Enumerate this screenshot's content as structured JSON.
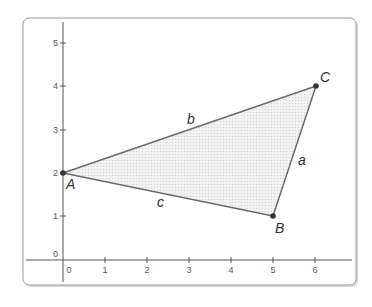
{
  "diagram": {
    "type": "coordinate-plane-triangle",
    "x_ticks": [
      "0",
      "1",
      "2",
      "3",
      "4",
      "5",
      "6"
    ],
    "y_ticks": [
      "0",
      "1",
      "2",
      "3",
      "4",
      "5"
    ],
    "points": [
      {
        "label": "A",
        "x": 0,
        "y": 2
      },
      {
        "label": "B",
        "x": 5,
        "y": 1
      },
      {
        "label": "C",
        "x": 6,
        "y": 4
      }
    ],
    "sides": [
      {
        "label": "a",
        "from": "B",
        "to": "C"
      },
      {
        "label": "b",
        "from": "A",
        "to": "C"
      },
      {
        "label": "c",
        "from": "A",
        "to": "B"
      }
    ],
    "colors": {
      "fill": "#e6e6e6",
      "stroke": "#666666",
      "axis": "#555555",
      "panel_border": "#9a9a9a"
    }
  }
}
